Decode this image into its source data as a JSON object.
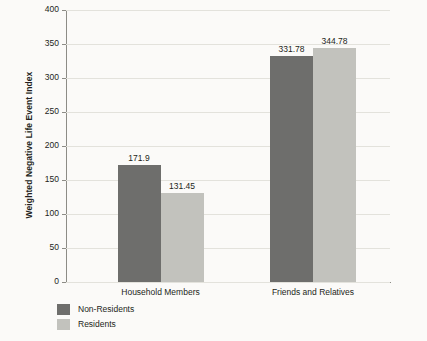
{
  "chart_data": {
    "type": "bar",
    "title": "",
    "xlabel": "",
    "ylabel": "Weighted Negative Life Event Index",
    "ylim": [
      0,
      400
    ],
    "yticks": [
      0,
      50,
      100,
      150,
      200,
      250,
      300,
      350,
      400
    ],
    "ytick_labels": [
      "0",
      "50",
      "100",
      "150",
      "200",
      "250",
      "300",
      "350",
      "400"
    ],
    "grid": true,
    "legend_position": "bottom-left",
    "categories": [
      "Household Members",
      "Friends and Relatives"
    ],
    "series": [
      {
        "name": "Non-Residents",
        "color": "#6e6e6c",
        "values": [
          171.9,
          331.78
        ],
        "labels": [
          "171.9",
          "331.78"
        ]
      },
      {
        "name": "Residents",
        "color": "#c2c2bd",
        "values": [
          131.45,
          344.78
        ],
        "labels": [
          "131.45",
          "344.78"
        ]
      }
    ]
  },
  "axis": {
    "y_title": "Weighted Negative Life Event Index"
  },
  "legend": {
    "items": [
      {
        "label": "Non-Residents",
        "color": "#6e6e6c"
      },
      {
        "label": "Residents",
        "color": "#c2c2bd"
      }
    ]
  },
  "colors": {
    "background": "#fbfaf8",
    "axis": "#8d8c86",
    "gridline": "#e3e2dc",
    "text": "#231f20",
    "series_dark": "#6e6e6c",
    "series_light": "#c2c2bd"
  }
}
